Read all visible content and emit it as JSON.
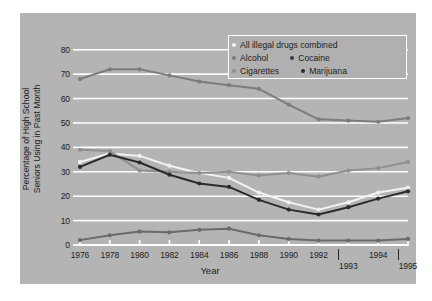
{
  "chart_data": {
    "type": "line",
    "title": "",
    "xlabel": "Year",
    "ylabel": "Percentage of High School Seniors Using in Past Month",
    "ylabel_line1": "Percentage of High School",
    "ylabel_line2": "Seniors Using in Past Month",
    "ylim": [
      0,
      84
    ],
    "yticks": [
      0,
      10,
      20,
      30,
      40,
      50,
      60,
      70,
      80
    ],
    "ytick_labels": [
      "0",
      "10",
      "20",
      "30",
      "40",
      "50",
      "60",
      "70",
      "80"
    ],
    "grid": true,
    "grid_color": "#ffffff",
    "background_color": "#b4b4b4",
    "figure_color": "#ffffff",
    "legend_position": "top-right",
    "x": [
      1976,
      1978,
      1980,
      1982,
      1984,
      1986,
      1988,
      1990,
      1992,
      1993,
      1994,
      1995
    ],
    "xtick_labels": [
      "1976",
      "1978",
      "1980",
      "1982",
      "1984",
      "1986",
      "1988",
      "1990",
      "1992",
      "1993",
      "1994",
      "1995"
    ],
    "xtick_rows": [
      0,
      0,
      0,
      0,
      0,
      0,
      0,
      0,
      0,
      1,
      0,
      1
    ],
    "series": [
      {
        "name": "All illegal drugs combined",
        "color": "#f2f2f2",
        "values": [
          34.0,
          37.5,
          36.5,
          32.5,
          29.5,
          27.5,
          21.5,
          17.5,
          14.5,
          17.5,
          21.5,
          23.5
        ]
      },
      {
        "name": "Alcohol",
        "color": "#7c7c7c",
        "values": [
          68.0,
          72.0,
          72.0,
          69.5,
          67.0,
          65.5,
          64.0,
          57.5,
          51.5,
          51.0,
          50.5,
          52.0
        ]
      },
      {
        "name": "Cigarettes",
        "color": "#8f8f8f",
        "values": [
          39.0,
          38.5,
          30.5,
          30.0,
          29.5,
          30.0,
          28.5,
          29.5,
          28.0,
          30.5,
          31.5,
          34.0
        ]
      },
      {
        "name": "Cocaine",
        "color": "#6a6a6a",
        "values": [
          2.0,
          4.0,
          5.5,
          5.2,
          6.2,
          6.7,
          4.0,
          2.5,
          1.8,
          1.8,
          1.8,
          2.5
        ]
      },
      {
        "name": "Marijuana",
        "color": "#2b2b2b",
        "values": [
          32.0,
          37.0,
          33.8,
          28.8,
          25.2,
          23.8,
          18.5,
          14.5,
          12.5,
          15.5,
          19.0,
          22.0
        ]
      }
    ]
  },
  "legend": {
    "rows": [
      [
        {
          "label": "All illegal drugs combined",
          "color": "#f2f2f2"
        }
      ],
      [
        {
          "label": "Alcohol",
          "color": "#7c7c7c"
        },
        {
          "label": "Cocaine",
          "color": "#3a3a3a"
        }
      ],
      [
        {
          "label": "Cigarettes",
          "color": "#8f8f8f"
        },
        {
          "label": "Marijuana",
          "color": "#2b2b2b"
        }
      ]
    ]
  }
}
